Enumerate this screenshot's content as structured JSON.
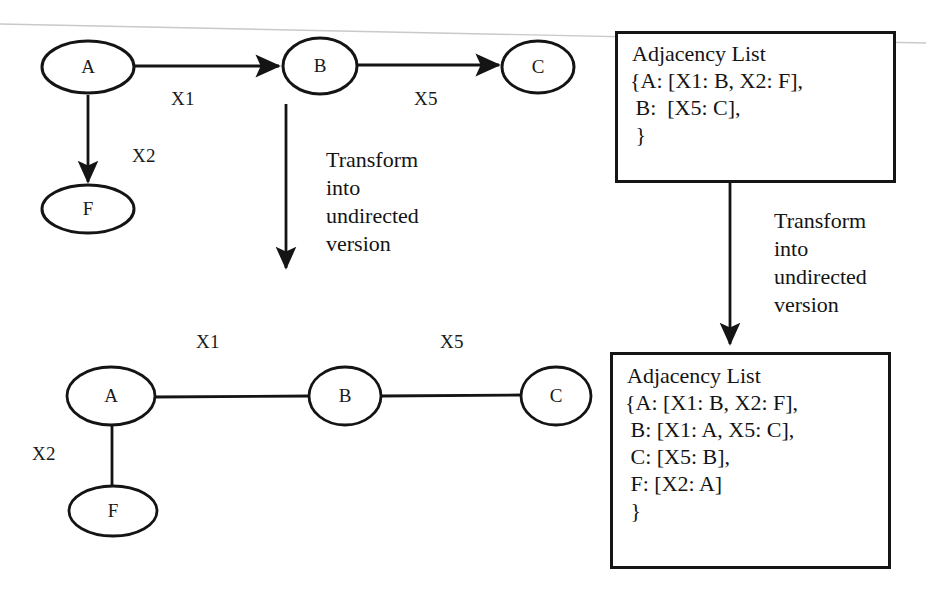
{
  "figure": {
    "background_color": "#ffffff",
    "ink_color": "#141414"
  },
  "directed_graph": {
    "name": "directed-graph",
    "nodes": [
      {
        "id": "A",
        "label": "A"
      },
      {
        "id": "B",
        "label": "B"
      },
      {
        "id": "C",
        "label": "C"
      },
      {
        "id": "F",
        "label": "F"
      }
    ],
    "edges": [
      {
        "from": "A",
        "to": "B",
        "label": "X1",
        "directed": true
      },
      {
        "from": "B",
        "to": "C",
        "label": "X5",
        "directed": true
      },
      {
        "from": "A",
        "to": "F",
        "label": "X2",
        "directed": true
      }
    ]
  },
  "undirected_graph": {
    "name": "undirected-graph",
    "nodes": [
      {
        "id": "A",
        "label": "A"
      },
      {
        "id": "B",
        "label": "B"
      },
      {
        "id": "C",
        "label": "C"
      },
      {
        "id": "F",
        "label": "F"
      }
    ],
    "edges": [
      {
        "from": "A",
        "to": "B",
        "label": "X1",
        "directed": false
      },
      {
        "from": "B",
        "to": "C",
        "label": "X5",
        "directed": false
      },
      {
        "from": "A",
        "to": "F",
        "label": "X2",
        "directed": false
      }
    ]
  },
  "transform_caption_graph": "Transform\ninto\nundirected\nversion",
  "transform_caption_list": "Transform\ninto\nundirected\nversion",
  "adjacency_list_directed": {
    "title": "Adjacency List",
    "body": "{A: [X1: B, X2: F],\n B:  [X5: C],\n }"
  },
  "adjacency_list_undirected": {
    "title": "Adjacency List",
    "body": "{A: [X1: B, X2: F],\n B: [X1: A, X5: C],\n C: [X5: B],\n F: [X2: A]\n }"
  },
  "node_labels": {
    "top_a": "A",
    "top_b": "B",
    "top_c": "C",
    "top_f": "F",
    "bottom_a": "A",
    "bottom_b": "B",
    "bottom_c": "C",
    "bottom_f": "F"
  },
  "edge_labels": {
    "top_x1": "X1",
    "top_x5": "X5",
    "top_x2": "X2",
    "bottom_x1": "X1",
    "bottom_x5": "X5",
    "bottom_x2": "X2"
  }
}
